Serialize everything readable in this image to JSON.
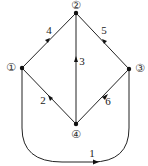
{
  "diagram": {
    "type": "directed-graph",
    "nodes": [
      {
        "id": "1",
        "label": "①",
        "x": 22,
        "y": 68,
        "label_x": 11,
        "label_y": 71
      },
      {
        "id": "2",
        "label": "②",
        "x": 76,
        "y": 13,
        "label_x": 76,
        "label_y": 9
      },
      {
        "id": "3",
        "label": "③",
        "x": 129,
        "y": 69,
        "label_x": 140,
        "label_y": 72
      },
      {
        "id": "4",
        "label": "④",
        "x": 76,
        "y": 124,
        "label_x": 76,
        "label_y": 138
      }
    ],
    "edges": [
      {
        "id": "e1",
        "label": "1",
        "from": "1",
        "to": "3",
        "shape": "curve-below"
      },
      {
        "id": "e2",
        "label": "2",
        "from": "4",
        "to": "1"
      },
      {
        "id": "e3",
        "label": "3",
        "from": "4",
        "to": "2"
      },
      {
        "id": "e4",
        "label": "4",
        "from": "1",
        "to": "2"
      },
      {
        "id": "e5",
        "label": "5",
        "from": "3",
        "to": "2"
      },
      {
        "id": "e6",
        "label": "6",
        "from": "4",
        "to": "3"
      }
    ]
  }
}
